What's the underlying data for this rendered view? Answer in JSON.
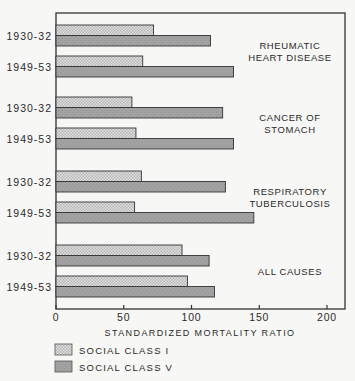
{
  "chart_data": {
    "type": "bar",
    "orientation": "horizontal",
    "title": "",
    "xlabel": "STANDARDIZED MORTALITY RATIO",
    "ylabel": "",
    "xlim": [
      0,
      212
    ],
    "xticks": [
      0,
      50,
      100,
      150,
      200
    ],
    "grid": false,
    "legend_position": "bottom-left",
    "groups": [
      {
        "label": [
          "RHEUMATIC",
          "HEART DISEASE"
        ],
        "periods": [
          "1930-32",
          "1949-53"
        ],
        "series": [
          {
            "name": "SOCIAL CLASS I",
            "values": [
              72,
              64
            ]
          },
          {
            "name": "SOCIAL CLASS V",
            "values": [
              114,
              131
            ]
          }
        ]
      },
      {
        "label": [
          "CANCER OF",
          "STOMACH"
        ],
        "periods": [
          "1930-32",
          "1949-53"
        ],
        "series": [
          {
            "name": "SOCIAL CLASS I",
            "values": [
              56,
              59
            ]
          },
          {
            "name": "SOCIAL CLASS V",
            "values": [
              123,
              131
            ]
          }
        ]
      },
      {
        "label": [
          "RESPIRATORY",
          "TUBERCULOSIS"
        ],
        "periods": [
          "1930-32",
          "1949-53"
        ],
        "series": [
          {
            "name": "SOCIAL CLASS I",
            "values": [
              63,
              58
            ]
          },
          {
            "name": "SOCIAL CLASS V",
            "values": [
              125,
              146
            ]
          }
        ]
      },
      {
        "label": [
          "ALL CAUSES"
        ],
        "periods": [
          "1930-32",
          "1949-53"
        ],
        "series": [
          {
            "name": "SOCIAL CLASS I",
            "values": [
              93,
              97
            ]
          },
          {
            "name": "SOCIAL CLASS V",
            "values": [
              113,
              117
            ]
          }
        ]
      }
    ],
    "legend": [
      {
        "name": "SOCIAL CLASS I",
        "pattern": "stippled",
        "color": "#d4d4d4"
      },
      {
        "name": "SOCIAL CLASS V",
        "pattern": "solid",
        "color": "#9c9c9c"
      }
    ]
  },
  "colors": {
    "background": "#f7f7f5",
    "ink": "#2a2a2a",
    "class_i_light": "#e6e6e6",
    "class_i_dark": "#b4b4b4",
    "class_v": "#9c9c9c"
  }
}
